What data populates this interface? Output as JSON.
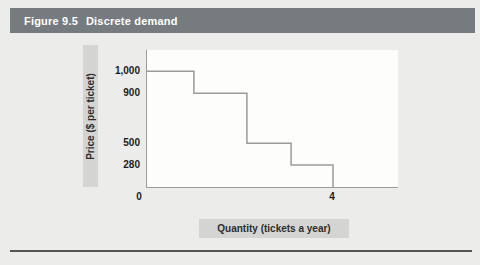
{
  "figure": {
    "label": "Figure 9.5",
    "name": "Discrete demand"
  },
  "colors": {
    "page_bg": "#ecedeb",
    "title_bar_bg": "#767b7f",
    "title_text": "#ffffff",
    "label_box_bg": "#d4d5d2",
    "label_text": "#2d2d2d",
    "axis_line": "#9c9c9c",
    "step_line": "#9a9a9a",
    "plot_bg": "#fdfdfc",
    "tick_text": "#1c1c1c",
    "bottom_rule": "#565656"
  },
  "chart_data": {
    "type": "line",
    "subtype": "step-function-demand-curve",
    "title": "Figure 9.5 Discrete demand",
    "xlabel": "Quantity (tickets a year)",
    "ylabel": "Price ($ per ticket)",
    "grid": false,
    "legend": false,
    "xlim": [
      0,
      5.4
    ],
    "ylim": [
      0,
      1180
    ],
    "x_ticks": [
      {
        "value": 0,
        "label": "0"
      },
      {
        "value": 4,
        "label": "4"
      }
    ],
    "y_ticks": [
      {
        "value": 1000,
        "label": "1,000"
      },
      {
        "value": 900,
        "label": "900"
      },
      {
        "value": 500,
        "label": "500"
      },
      {
        "value": 280,
        "label": "280"
      }
    ],
    "steps": [
      {
        "quantity_from": 0,
        "quantity_to": 1,
        "price": 1000
      },
      {
        "quantity_from": 1,
        "quantity_to": 2,
        "price": 900
      },
      {
        "quantity_from": 2,
        "quantity_to": 3,
        "price": 500
      },
      {
        "quantity_from": 3,
        "quantity_to": 4,
        "price": 280
      }
    ],
    "drops_to_zero_at_quantity": 4,
    "layout": {
      "plot_px": {
        "width": 251,
        "height": 137
      },
      "quantity_frac_of_plot_width": {
        "0": 0,
        "1": 0.187,
        "2": 0.398,
        "3": 0.574,
        "4": 0.741
      },
      "price_frac_from_plot_top": {
        "1000": 0.155,
        "900": 0.315,
        "500": 0.68,
        "280": 0.84
      }
    }
  }
}
